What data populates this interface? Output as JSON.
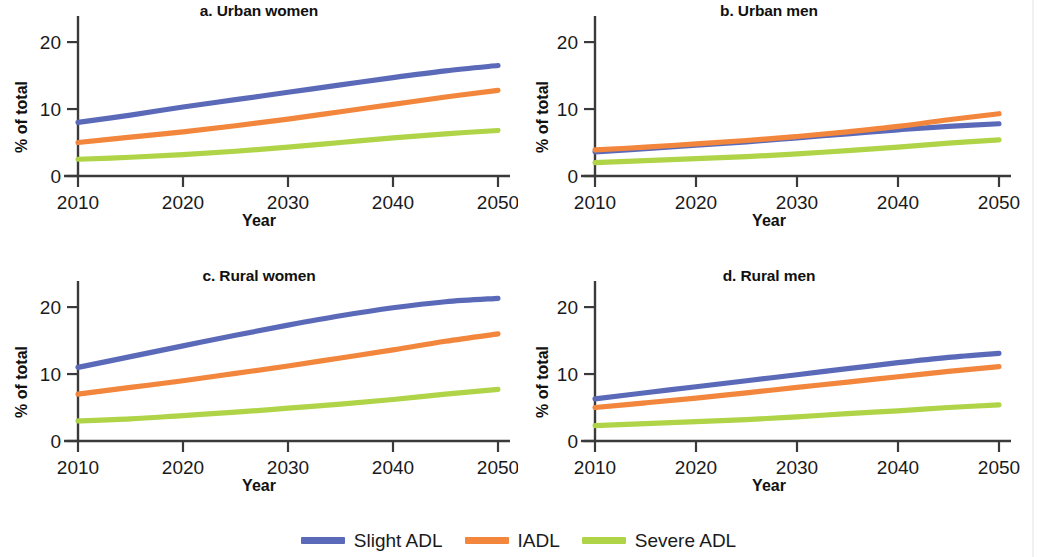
{
  "figure": {
    "background": "#ffffff"
  },
  "axis": {
    "ylabel": "% of total",
    "xlabel": "Year",
    "yticks": [
      "0",
      "10",
      "20"
    ],
    "xticks": [
      "2010",
      "2020",
      "2030",
      "2040",
      "2050"
    ]
  },
  "legend": {
    "position": "bottom-center",
    "items": [
      {
        "label": "Slight ADL",
        "color": "#5b6ab8"
      },
      {
        "label": "IADL",
        "color": "#f2863c"
      },
      {
        "label": "Severe ADL",
        "color": "#b0d447"
      }
    ]
  },
  "panels": [
    {
      "key": "a",
      "title": "a. Urban women"
    },
    {
      "key": "b",
      "title": "b. Urban men"
    },
    {
      "key": "c",
      "title": "c. Rural women"
    },
    {
      "key": "d",
      "title": "d. Rural men"
    }
  ],
  "chart_data": [
    {
      "type": "line",
      "title": "a. Urban women",
      "xlabel": "Year",
      "ylabel": "% of total",
      "x": [
        2010,
        2015,
        2020,
        2025,
        2030,
        2035,
        2040,
        2045,
        2050
      ],
      "xlim": [
        2010,
        2050
      ],
      "ylim": [
        0,
        23
      ],
      "yticks": [
        0,
        10,
        20
      ],
      "xticks": [
        2010,
        2020,
        2030,
        2040,
        2050
      ],
      "grid": false,
      "legend_position": "figure-bottom",
      "series": [
        {
          "name": "Slight ADL",
          "color": "#5b6ab8",
          "values": [
            8.0,
            9.1,
            10.3,
            11.4,
            12.5,
            13.6,
            14.7,
            15.7,
            16.5
          ]
        },
        {
          "name": "IADL",
          "color": "#f2863c",
          "values": [
            5.0,
            5.8,
            6.6,
            7.5,
            8.5,
            9.6,
            10.7,
            11.8,
            12.8
          ]
        },
        {
          "name": "Severe ADL",
          "color": "#b0d447",
          "values": [
            2.5,
            2.8,
            3.2,
            3.7,
            4.3,
            5.0,
            5.7,
            6.3,
            6.8
          ]
        }
      ]
    },
    {
      "type": "line",
      "title": "b. Urban men",
      "xlabel": "Year",
      "ylabel": "% of total",
      "x": [
        2010,
        2015,
        2020,
        2025,
        2030,
        2035,
        2040,
        2045,
        2050
      ],
      "xlim": [
        2010,
        2050
      ],
      "ylim": [
        0,
        23
      ],
      "yticks": [
        0,
        10,
        20
      ],
      "xticks": [
        2010,
        2020,
        2030,
        2040,
        2050
      ],
      "grid": false,
      "legend_position": "figure-bottom",
      "series": [
        {
          "name": "Slight ADL",
          "color": "#5b6ab8",
          "values": [
            3.6,
            4.1,
            4.6,
            5.1,
            5.7,
            6.3,
            6.9,
            7.4,
            7.8
          ]
        },
        {
          "name": "IADL",
          "color": "#f2863c",
          "values": [
            3.9,
            4.3,
            4.8,
            5.3,
            5.9,
            6.6,
            7.4,
            8.4,
            9.3
          ]
        },
        {
          "name": "Severe ADL",
          "color": "#b0d447",
          "values": [
            2.0,
            2.3,
            2.6,
            2.9,
            3.3,
            3.8,
            4.3,
            4.9,
            5.4
          ]
        }
      ]
    },
    {
      "type": "line",
      "title": "c. Rural women",
      "xlabel": "Year",
      "ylabel": "% of total",
      "x": [
        2010,
        2015,
        2020,
        2025,
        2030,
        2035,
        2040,
        2045,
        2050
      ],
      "xlim": [
        2010,
        2050
      ],
      "ylim": [
        0,
        23
      ],
      "yticks": [
        0,
        10,
        20
      ],
      "xticks": [
        2010,
        2020,
        2030,
        2040,
        2050
      ],
      "grid": false,
      "legend_position": "figure-bottom",
      "series": [
        {
          "name": "Slight ADL",
          "color": "#5b6ab8",
          "values": [
            11.0,
            12.6,
            14.2,
            15.8,
            17.3,
            18.7,
            19.9,
            20.8,
            21.3
          ]
        },
        {
          "name": "IADL",
          "color": "#f2863c",
          "values": [
            7.0,
            8.0,
            9.0,
            10.1,
            11.2,
            12.4,
            13.6,
            14.9,
            16.0
          ]
        },
        {
          "name": "Severe ADL",
          "color": "#b0d447",
          "values": [
            3.0,
            3.3,
            3.8,
            4.3,
            4.9,
            5.5,
            6.2,
            7.0,
            7.7
          ]
        }
      ]
    },
    {
      "type": "line",
      "title": "d. Rural men",
      "xlabel": "Year",
      "ylabel": "% of total",
      "x": [
        2010,
        2015,
        2020,
        2025,
        2030,
        2035,
        2040,
        2045,
        2050
      ],
      "xlim": [
        2010,
        2050
      ],
      "ylim": [
        0,
        23
      ],
      "yticks": [
        0,
        10,
        20
      ],
      "xticks": [
        2010,
        2020,
        2030,
        2040,
        2050
      ],
      "grid": false,
      "legend_position": "figure-bottom",
      "series": [
        {
          "name": "Slight ADL",
          "color": "#5b6ab8",
          "values": [
            6.3,
            7.2,
            8.1,
            9.0,
            9.9,
            10.8,
            11.7,
            12.5,
            13.1
          ]
        },
        {
          "name": "IADL",
          "color": "#f2863c",
          "values": [
            5.0,
            5.7,
            6.4,
            7.2,
            8.0,
            8.8,
            9.6,
            10.4,
            11.1
          ]
        },
        {
          "name": "Severe ADL",
          "color": "#b0d447",
          "values": [
            2.3,
            2.6,
            2.9,
            3.2,
            3.6,
            4.1,
            4.5,
            5.0,
            5.4
          ]
        }
      ]
    }
  ]
}
